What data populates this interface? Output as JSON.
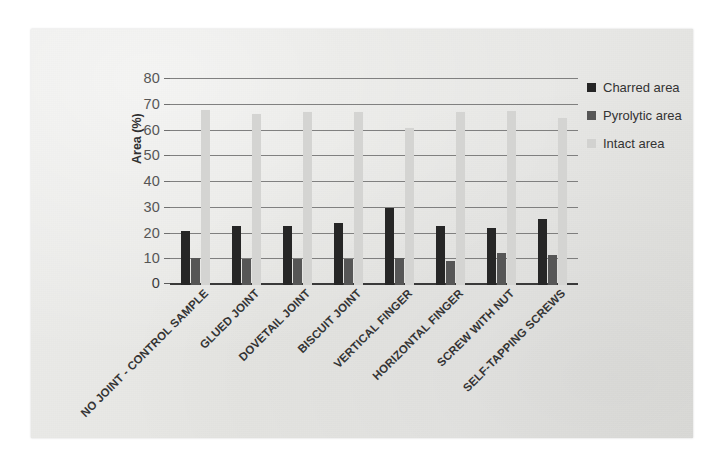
{
  "chart_data": {
    "type": "bar",
    "title": "",
    "xlabel": "",
    "ylabel": "Area (%)",
    "ylim": [
      0,
      80
    ],
    "yticks": [
      0,
      10,
      20,
      30,
      40,
      50,
      60,
      70,
      80
    ],
    "grid": true,
    "legend_position": "right",
    "categories": [
      "NO JOINT - CONTROL SAMPLE",
      "GLUED JOINT",
      "DOVETAIL JOINT",
      "BISCUIT JOINT",
      "VERTICAL FINGER",
      "HORIZONTAL FINGER",
      "SCREW WITH NUT",
      "SELF-TAPPING SCREWS"
    ],
    "series": [
      {
        "name": "Charred area",
        "color": "#262626",
        "values": [
          21,
          23,
          23,
          24,
          30,
          23,
          22,
          25.5
        ]
      },
      {
        "name": "Pyrolytic area",
        "color": "#565656",
        "values": [
          10.5,
          10,
          10,
          10,
          10.5,
          9.5,
          12.5,
          11.5
        ]
      },
      {
        "name": "Intact area",
        "color": "#d4d4d2",
        "values": [
          68,
          66.5,
          67,
          67,
          61,
          67,
          67.5,
          65
        ]
      }
    ]
  },
  "legend": {
    "items": [
      {
        "label": "Charred area",
        "swatch": "charred"
      },
      {
        "label": "Pyrolytic area",
        "swatch": "pyrolytic"
      },
      {
        "label": "Intact area",
        "swatch": "intact"
      }
    ]
  },
  "axis": {
    "y_title": "Area (%)"
  }
}
